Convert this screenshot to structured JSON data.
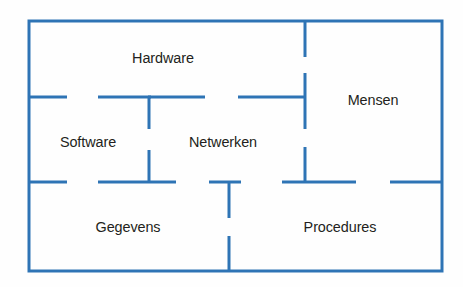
{
  "diagram": {
    "name": "informatiesysteem-componenten-plattegrond",
    "type": "floor-plan-diagram",
    "language": "nl",
    "colors": {
      "wall": "#2E74B5",
      "outer_border": "#2E74B5",
      "label_text": "#231F20",
      "background": "#FEFEFE"
    },
    "outer_border": {
      "x": 29,
      "y": 21,
      "width": 413,
      "height": 250,
      "stroke_width": 3
    },
    "rooms": [
      {
        "id": "hardware",
        "label": "Hardware",
        "label_x": 163,
        "label_y": 58
      },
      {
        "id": "mensen",
        "label": "Mensen",
        "label_x": 373,
        "label_y": 100
      },
      {
        "id": "software",
        "label": "Software",
        "label_x": 88,
        "label_y": 142
      },
      {
        "id": "netwerken",
        "label": "Netwerken",
        "label_x": 223,
        "label_y": 142
      },
      {
        "id": "gegevens",
        "label": "Gegevens",
        "label_x": 128,
        "label_y": 227
      },
      {
        "id": "procedures",
        "label": "Procedures",
        "label_x": 340,
        "label_y": 227
      }
    ],
    "walls": [
      {
        "id": "wall-h-mid-left-a",
        "orientation": "horizontal",
        "x1": 29,
        "y1": 97,
        "x2": 67,
        "y2": 97
      },
      {
        "id": "wall-h-mid-left-b",
        "orientation": "horizontal",
        "x1": 98,
        "y1": 97,
        "x2": 151,
        "y2": 97
      },
      {
        "id": "wall-h-mid-center",
        "orientation": "horizontal",
        "x1": 151,
        "y1": 97,
        "x2": 205,
        "y2": 97
      },
      {
        "id": "wall-h-mid-right-a",
        "orientation": "horizontal",
        "x1": 238,
        "y1": 97,
        "x2": 306,
        "y2": 97
      },
      {
        "id": "wall-h-low-left-a",
        "orientation": "horizontal",
        "x1": 29,
        "y1": 182,
        "x2": 67,
        "y2": 182
      },
      {
        "id": "wall-h-low-left-b",
        "orientation": "horizontal",
        "x1": 98,
        "y1": 182,
        "x2": 176,
        "y2": 182
      },
      {
        "id": "wall-h-low-center",
        "orientation": "horizontal",
        "x1": 209,
        "y1": 182,
        "x2": 241,
        "y2": 182
      },
      {
        "id": "wall-h-low-right-a",
        "orientation": "horizontal",
        "x1": 282,
        "y1": 182,
        "x2": 356,
        "y2": 182
      },
      {
        "id": "wall-h-low-right-b",
        "orientation": "horizontal",
        "x1": 390,
        "y1": 182,
        "x2": 442,
        "y2": 182
      },
      {
        "id": "wall-v-left-upper",
        "orientation": "vertical",
        "x1": 149,
        "y1": 97,
        "x2": 149,
        "y2": 129
      },
      {
        "id": "wall-v-left-lower",
        "orientation": "vertical",
        "x1": 149,
        "y1": 150,
        "x2": 149,
        "y2": 183
      },
      {
        "id": "wall-v-center-upper",
        "orientation": "vertical",
        "x1": 229,
        "y1": 182,
        "x2": 229,
        "y2": 218
      },
      {
        "id": "wall-v-center-lower",
        "orientation": "vertical",
        "x1": 229,
        "y1": 236,
        "x2": 229,
        "y2": 271
      },
      {
        "id": "wall-v-right-top",
        "orientation": "vertical",
        "x1": 305,
        "y1": 21,
        "x2": 305,
        "y2": 57
      },
      {
        "id": "wall-v-right-mid",
        "orientation": "vertical",
        "x1": 305,
        "y1": 73,
        "x2": 305,
        "y2": 129
      },
      {
        "id": "wall-v-right-low",
        "orientation": "vertical",
        "x1": 305,
        "y1": 147,
        "x2": 305,
        "y2": 183
      }
    ]
  }
}
